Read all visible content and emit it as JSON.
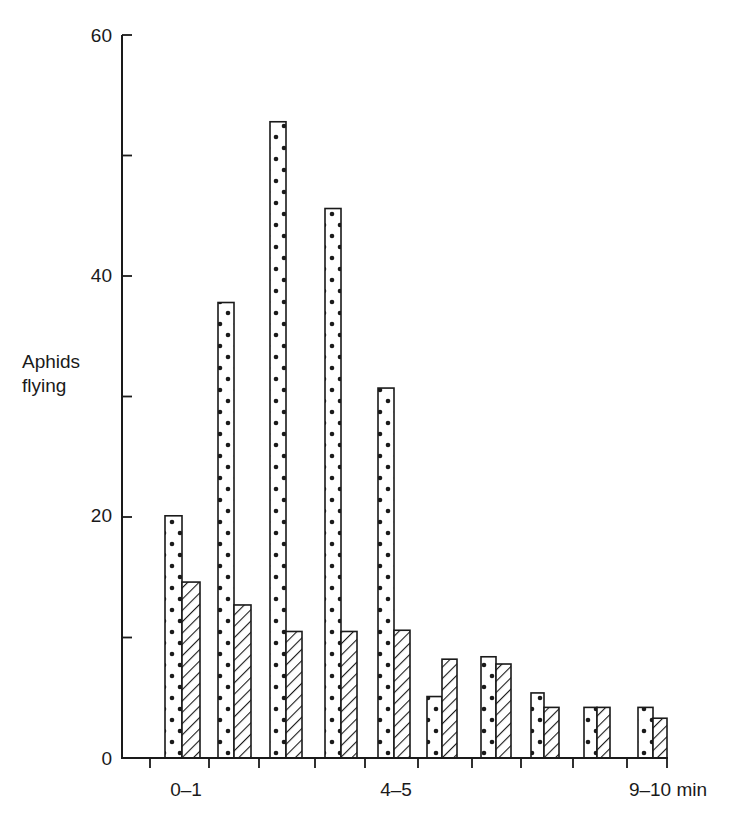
{
  "chart_data": {
    "type": "bar",
    "title": "",
    "xlabel": "min",
    "ylabel": "Aphids flying",
    "ylim": [
      0,
      60
    ],
    "yticks": [
      0,
      10,
      20,
      30,
      40,
      50,
      60
    ],
    "ytick_labels": [
      "0",
      "",
      "20",
      "",
      "40",
      "",
      "60"
    ],
    "categories": [
      "0-1",
      "1-2",
      "2-3",
      "3-4",
      "4-5",
      "5-6",
      "6-7",
      "7-8",
      "8-9",
      "9-10"
    ],
    "xtick_labels_shown": [
      {
        "index": 0,
        "label": "0–1"
      },
      {
        "index": 4,
        "label": "4–5"
      },
      {
        "index": 9,
        "label": "9–10 min"
      }
    ],
    "series": [
      {
        "name": "dotted",
        "pattern": "dots",
        "values": [
          20.1,
          37.8,
          52.8,
          45.6,
          30.7,
          5.1,
          8.4,
          5.4,
          4.2,
          4.2
        ]
      },
      {
        "name": "hatched",
        "pattern": "diagonal-hatch",
        "values": [
          14.6,
          12.7,
          10.5,
          10.5,
          10.6,
          8.2,
          7.8,
          4.2,
          4.2,
          3.3
        ]
      }
    ],
    "grid": false,
    "legend": null
  },
  "labels": {
    "ylabel_line1": "Aphids",
    "ylabel_line2": "flying",
    "y0": "0",
    "y20": "20",
    "y40": "40",
    "y60": "60",
    "x0": "0–1",
    "x4": "4–5",
    "x9": "9–10 min"
  },
  "colors": {
    "ink": "#1a1a1a",
    "background": "#ffffff"
  }
}
